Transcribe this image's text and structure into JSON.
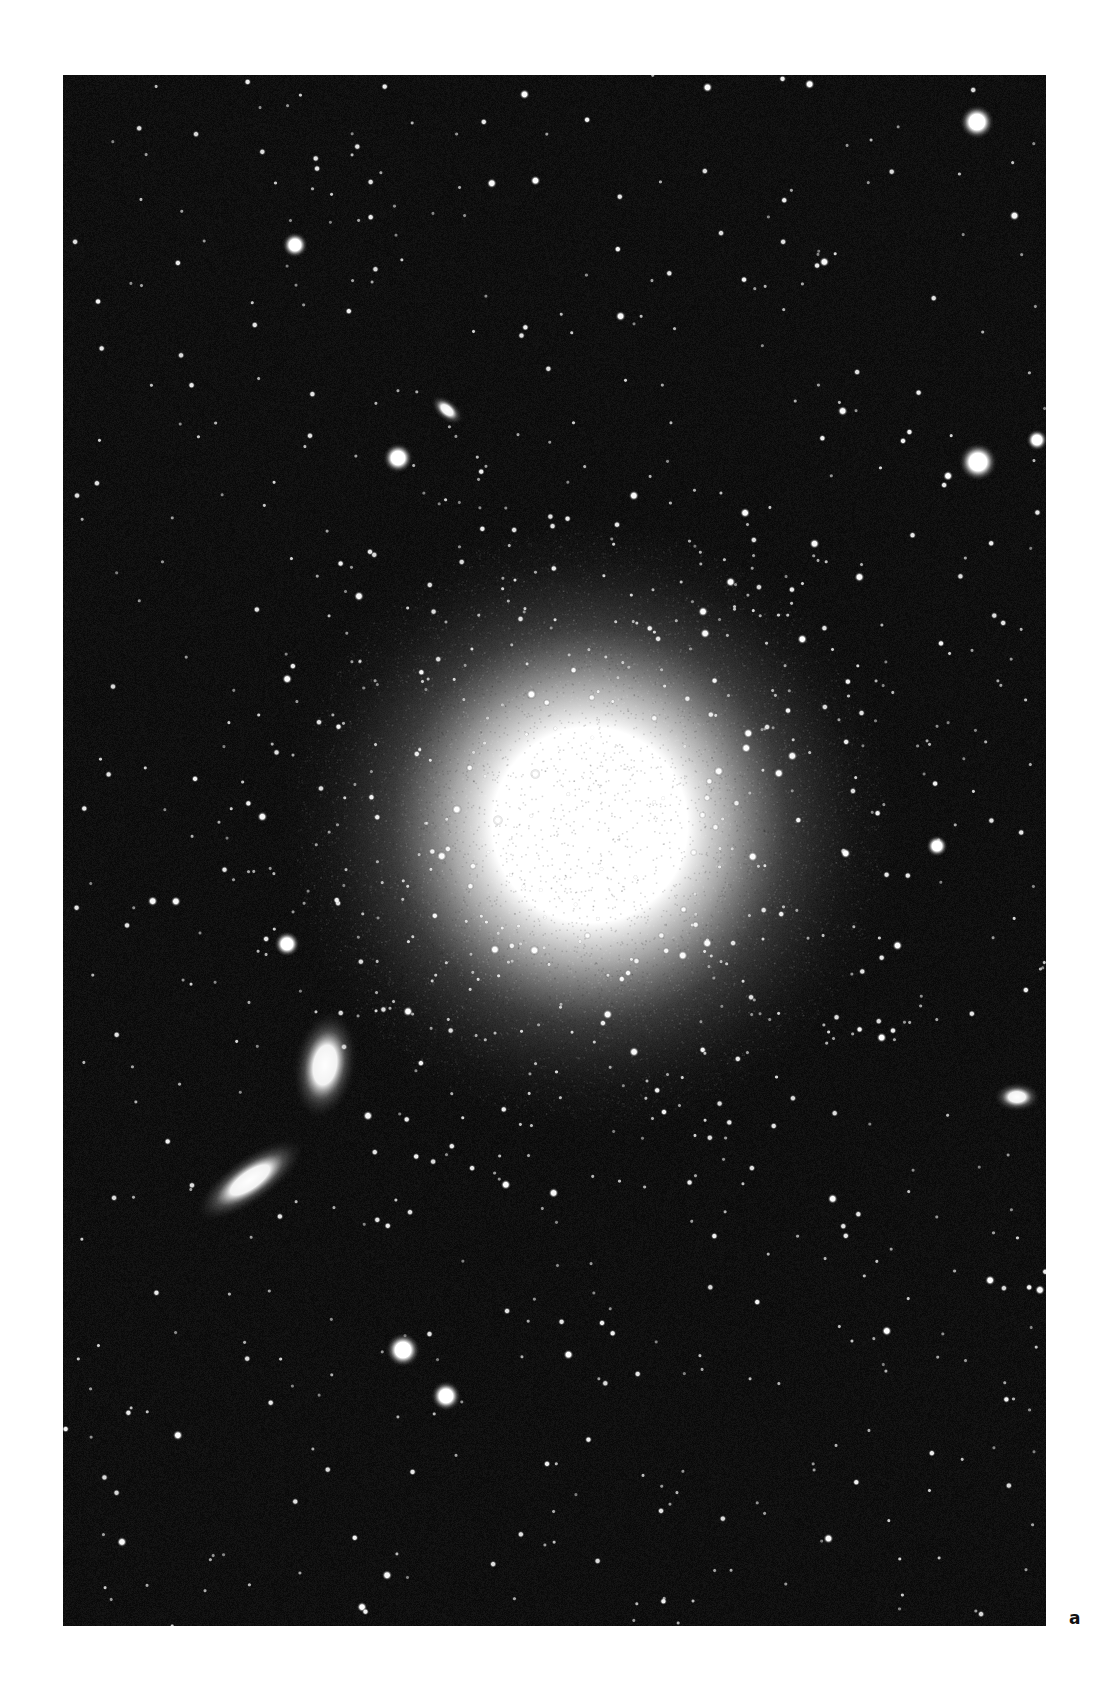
{
  "page": {
    "running_head": {
      "page_number": "",
      "title": ""
    },
    "panel_label": "a"
  },
  "photo": {
    "description": "Astronomical photograph: giant elliptical galaxy with companion galaxies in a dense star field",
    "background_color": "#0a0a0a",
    "main_galaxy": {
      "cx": 527,
      "cy": 750,
      "core_radius": 115,
      "halo_radius": 330
    },
    "companion_galaxies": [
      {
        "name": "companion-galaxy-upper",
        "cx": 262,
        "cy": 990,
        "rx": 15,
        "ry": 26,
        "angle": 10
      },
      {
        "name": "companion-galaxy-lower",
        "cx": 187,
        "cy": 1105,
        "rx": 30,
        "ry": 11,
        "angle": -35
      },
      {
        "name": "small-galaxy-top",
        "cx": 384,
        "cy": 335,
        "rx": 9,
        "ry": 5,
        "angle": 40
      },
      {
        "name": "small-galaxy-right",
        "cx": 954,
        "cy": 1022,
        "rx": 11,
        "ry": 7,
        "angle": 0
      }
    ],
    "bright_stars": [
      {
        "x": 914,
        "y": 47,
        "r": 8
      },
      {
        "x": 232,
        "y": 170,
        "r": 6
      },
      {
        "x": 335,
        "y": 383,
        "r": 7
      },
      {
        "x": 915,
        "y": 387,
        "r": 9
      },
      {
        "x": 974,
        "y": 365,
        "r": 5
      },
      {
        "x": 224,
        "y": 869,
        "r": 6
      },
      {
        "x": 874,
        "y": 771,
        "r": 5
      },
      {
        "x": 340,
        "y": 1275,
        "r": 8
      },
      {
        "x": 383,
        "y": 1321,
        "r": 7
      }
    ],
    "field_stars": {
      "seed": 1337,
      "count": 900
    }
  }
}
